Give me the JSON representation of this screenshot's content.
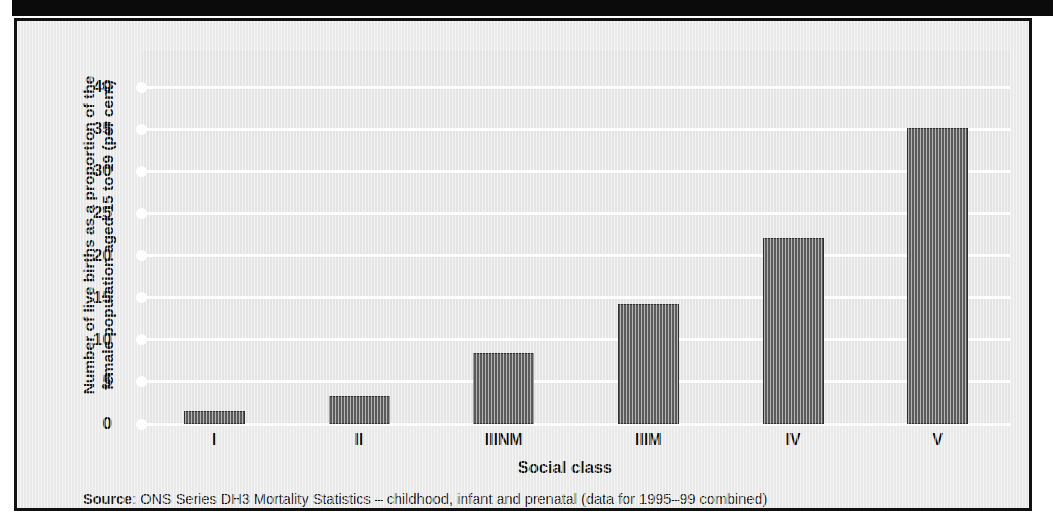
{
  "figure": {
    "ylabel_line1": "Number of live births as a proportion of the",
    "ylabel_line2": "female population aged 15 to 19 (per cent)",
    "xlabel": "Social class",
    "source_label": "Source",
    "source_separator": ": ",
    "source_text": "ONS Series DH3 Mortality Statistics – childhood, infant and prenatal (data for 1995–99 combined)"
  },
  "colors": {
    "bar_fill": "#5b5b5b",
    "bar_stroke": "#2e2e2e",
    "plot_background": "#e4e4e4",
    "figure_background": "#e9e9e9",
    "gridline": "#ffffff",
    "frame": "#111111",
    "top_band": "#0b0b0b",
    "text": "#111111"
  },
  "chart_data": {
    "type": "bar",
    "title": "",
    "subtitle": "",
    "categories": [
      "I",
      "II",
      "IIINM",
      "IIIM",
      "IV",
      "V"
    ],
    "values": [
      1.6,
      3.3,
      8.4,
      14.3,
      22.1,
      35.1
    ],
    "series": [
      {
        "name": "Live births to females aged 15 to 19",
        "values": [
          1.6,
          3.3,
          8.4,
          14.3,
          22.1,
          35.1
        ]
      }
    ],
    "xlabel": "Social class",
    "ylabel": "Number of live births as a proportion of the female population aged 15 to 19 (per cent)",
    "ylim": [
      0,
      40
    ],
    "yticks": [
      0,
      5,
      10,
      15,
      20,
      25,
      30,
      35,
      40
    ],
    "ytick_labels": [
      "0",
      "5",
      "10",
      "15",
      "20",
      "25",
      "30",
      "35",
      "40"
    ],
    "grid": true,
    "grid_axis": "y",
    "legend": false,
    "legend_position": "none",
    "source": "ONS Series DH3 Mortality Statistics – childhood, infant and prenatal (data for 1995–99 combined)"
  }
}
